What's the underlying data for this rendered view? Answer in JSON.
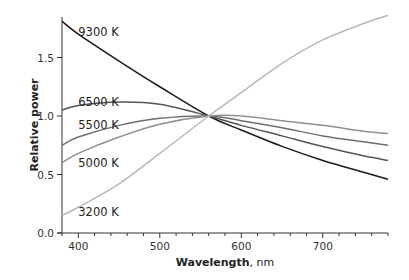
{
  "chart_data": {
    "type": "line",
    "title": "",
    "xlabel": "Wavelength",
    "xlabel_unit": "nm",
    "ylabel": "Relative power",
    "xlim": [
      380,
      780
    ],
    "ylim": [
      0,
      1.85
    ],
    "xticks": [
      400,
      500,
      600,
      700
    ],
    "xtick_labels": [
      "400",
      "500",
      "600",
      "700"
    ],
    "yticks": [
      0.0,
      0.5,
      1.0,
      1.5
    ],
    "ytick_labels": [
      "0.0",
      "0.5",
      "1.0",
      "1.5"
    ],
    "grid": false,
    "legend": "inline labels",
    "x": [
      380,
      400,
      450,
      500,
      560,
      600,
      650,
      700,
      750,
      780
    ],
    "series": [
      {
        "name": "9300 K",
        "color": "#1a1a1a",
        "values": [
          1.81,
          1.7,
          1.47,
          1.25,
          1.0,
          0.88,
          0.74,
          0.62,
          0.52,
          0.46
        ],
        "label_x": 400,
        "label_y": 1.72
      },
      {
        "name": "6500 K",
        "color": "#555555",
        "values": [
          1.05,
          1.09,
          1.12,
          1.1,
          1.0,
          0.92,
          0.83,
          0.74,
          0.66,
          0.62
        ],
        "label_x": 400,
        "label_y": 1.12
      },
      {
        "name": "5500 K",
        "color": "#6e6e6e",
        "values": [
          0.75,
          0.82,
          0.92,
          0.98,
          1.0,
          0.96,
          0.9,
          0.83,
          0.78,
          0.75
        ],
        "label_x": 400,
        "label_y": 0.92
      },
      {
        "name": "5000 K",
        "color": "#909090",
        "values": [
          0.6,
          0.68,
          0.82,
          0.93,
          1.0,
          1.0,
          0.96,
          0.92,
          0.87,
          0.85
        ],
        "label_x": 400,
        "label_y": 0.6
      },
      {
        "name": "3200 K",
        "color": "#b8b8b8",
        "values": [
          0.15,
          0.22,
          0.42,
          0.68,
          1.0,
          1.2,
          1.45,
          1.65,
          1.79,
          1.86
        ],
        "label_x": 400,
        "label_y": 0.18
      }
    ]
  }
}
